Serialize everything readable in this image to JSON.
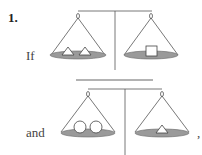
{
  "problem": {
    "number": "1.",
    "scales": [
      {
        "label": "If",
        "left_pan": [
          "triangle",
          "triangle"
        ],
        "right_pan": [
          "square"
        ]
      },
      {
        "label": "and",
        "left_pan": [
          "circle",
          "circle"
        ],
        "right_pan": [
          "triangle"
        ],
        "trailing": ","
      }
    ]
  },
  "colors": {
    "line": "#555555",
    "pan_fill": "#9a9a9a",
    "shape_fill": "#ffffff"
  }
}
